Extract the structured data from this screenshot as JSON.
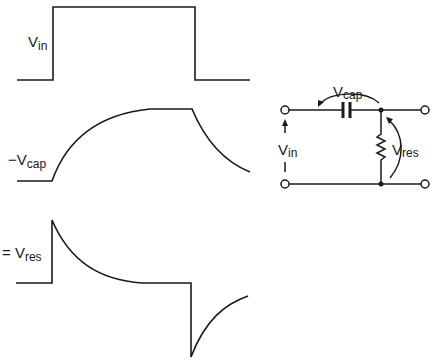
{
  "waveforms": {
    "vin": {
      "label": "V",
      "subscript": "in"
    },
    "vcap": {
      "label": "−V",
      "subscript": "cap"
    },
    "vres": {
      "label": "= V",
      "subscript": "res"
    }
  },
  "circuit": {
    "vcap_label": "V",
    "vcap_sub": "cap",
    "vres_label": "V",
    "vres_sub": "res",
    "vin_label": "V",
    "vin_sub": "in"
  },
  "colors": {
    "ink": "#1a1a1a",
    "background": "#ffffff"
  }
}
